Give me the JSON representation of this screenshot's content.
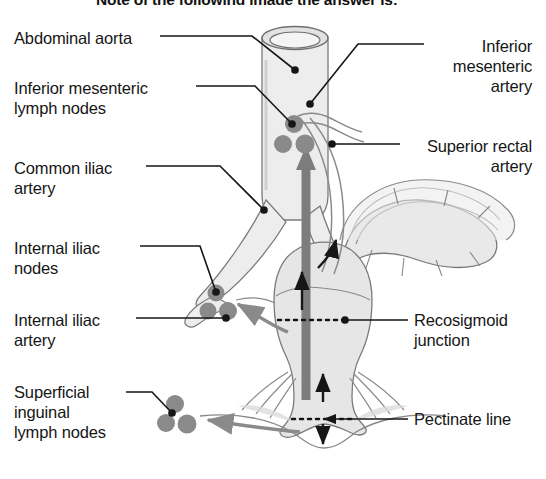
{
  "figure": {
    "title_partial": "Note of the following image the answer is:",
    "type": "anatomical-diagram",
    "background_color": "#ffffff",
    "ink_color": "#1a1a1a",
    "organ_fill": "#e9e9e9",
    "organ_stroke": "#777777",
    "node_color": "#8a8a8a",
    "flow_arrow_color": "#7d7d7d",
    "dark_arrow_color": "#141414"
  },
  "labels_left": [
    {
      "id": "abdominal-aorta",
      "text": "Abdominal aorta",
      "x": 14,
      "y": 28
    },
    {
      "id": "inferior-mesenteric-lymph-nodes",
      "text": "Inferior mesenteric\nlymph nodes",
      "x": 14,
      "y": 78
    },
    {
      "id": "common-iliac-artery",
      "text": "Common iliac\nartery",
      "x": 14,
      "y": 158
    },
    {
      "id": "internal-iliac-nodes",
      "text": "Internal iliac\nnodes",
      "x": 14,
      "y": 238
    },
    {
      "id": "internal-iliac-artery",
      "text": "Internal iliac\nartery",
      "x": 14,
      "y": 310
    },
    {
      "id": "superficial-inguinal-lymph-nodes",
      "text": "Superficial\ninguinal\nlymph nodes",
      "x": 14,
      "y": 382
    }
  ],
  "labels_right": [
    {
      "id": "inferior-mesenteric-artery",
      "text": "Inferior\nmesenteric\nartery",
      "x": 432,
      "y": 36,
      "width": 100
    },
    {
      "id": "superior-rectal-artery",
      "text": "Superior rectal\nartery",
      "x": 408,
      "y": 136,
      "width": 124
    },
    {
      "id": "rectosigmoid-junction",
      "text": "Recosigmoid\njunction",
      "x": 414,
      "y": 310,
      "width": 124
    },
    {
      "id": "pectinate-line",
      "text": "Pectinate line",
      "x": 414,
      "y": 409,
      "width": 124
    }
  ],
  "structures": [
    "abdominal aorta (cut cylinder)",
    "common iliac arteries",
    "internal iliac artery",
    "inferior mesenteric artery",
    "superior rectal artery",
    "sigmoid colon",
    "rectum",
    "anal canal",
    "pectinate line (dotted)",
    "rectosigmoid junction (dotted)",
    "inferior mesenteric lymph nodes",
    "internal iliac lymph nodes",
    "superficial inguinal lymph nodes",
    "lymphatic drainage flow arrows"
  ]
}
